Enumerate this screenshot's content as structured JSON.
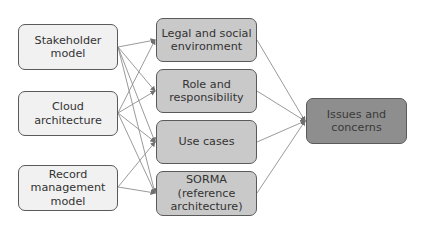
{
  "diagram": {
    "type": "flow",
    "sources": [
      {
        "id": "stakeholder",
        "label": "Stakeholder\nmodel"
      },
      {
        "id": "cloud",
        "label": "Cloud\narchitecture"
      },
      {
        "id": "record",
        "label": "Record\nmanagement\nmodel"
      }
    ],
    "intermediates": [
      {
        "id": "legal",
        "label": "Legal and social\nenvironment"
      },
      {
        "id": "role",
        "label": "Role and\nresponsibility"
      },
      {
        "id": "usecases",
        "label": "Use cases"
      },
      {
        "id": "sorma",
        "label": "SORMA\n(reference\narchitecture)"
      }
    ],
    "target": {
      "id": "issues",
      "label": "Issues and\nconcerns"
    },
    "edges": [
      [
        "stakeholder",
        "legal"
      ],
      [
        "stakeholder",
        "role"
      ],
      [
        "stakeholder",
        "usecases"
      ],
      [
        "stakeholder",
        "sorma"
      ],
      [
        "cloud",
        "legal"
      ],
      [
        "cloud",
        "role"
      ],
      [
        "cloud",
        "usecases"
      ],
      [
        "cloud",
        "sorma"
      ],
      [
        "record",
        "usecases"
      ],
      [
        "record",
        "sorma"
      ],
      [
        "legal",
        "issues"
      ],
      [
        "role",
        "issues"
      ],
      [
        "usecases",
        "issues"
      ],
      [
        "sorma",
        "issues"
      ]
    ],
    "colors": {
      "source_fill": "#f1f1f1",
      "intermediate_fill": "#c9c9c9",
      "target_fill": "#8e8e8e",
      "border": "#5a5a5a",
      "edge": "#8a8a8a"
    }
  }
}
